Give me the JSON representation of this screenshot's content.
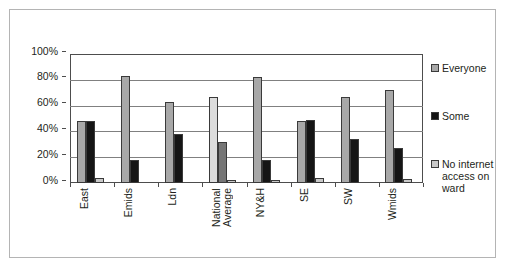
{
  "chart_data": {
    "type": "bar",
    "title": "",
    "subtitle": "",
    "xlabel": "",
    "ylabel": "",
    "ylim": [
      0,
      100
    ],
    "yticks": [
      "0%",
      "20%",
      "40%",
      "60%",
      "80%",
      "100%"
    ],
    "ytick_values": [
      0,
      20,
      40,
      60,
      80,
      100
    ],
    "grid": true,
    "legend_position": "right",
    "categories": [
      "East",
      "Emids",
      "Ldn",
      "National Average",
      "NY&H",
      "SE",
      "SW",
      "Wmids"
    ],
    "category_lines": [
      [
        "East"
      ],
      [
        "Emids"
      ],
      [
        "Ldn"
      ],
      [
        "National",
        "Average"
      ],
      [
        "NY&H"
      ],
      [
        "SE"
      ],
      [
        "SW"
      ],
      [
        "Wmids"
      ]
    ],
    "series": [
      {
        "name": "Everyone",
        "color": "#a8a8a8",
        "values": [
          48,
          83,
          63,
          67,
          82,
          48,
          67,
          72
        ]
      },
      {
        "name": "Some",
        "color": "#151515",
        "values": [
          48,
          18,
          38,
          32,
          18,
          49,
          34,
          27
        ]
      },
      {
        "name": "No internet access on ward",
        "color": "#c9c9c9",
        "values": [
          4,
          0,
          0,
          2,
          2,
          4,
          0,
          3
        ]
      }
    ]
  },
  "legend": {
    "items": [
      {
        "label": "Everyone",
        "swatch": "everyone"
      },
      {
        "label": "Some",
        "swatch": "some"
      },
      {
        "label": "No internet access on ward",
        "swatch": "nointernet"
      }
    ]
  },
  "axes": {
    "y": {
      "tick_labels": [
        "100%",
        "80%",
        "60%",
        "40%",
        "20%",
        "0%"
      ]
    }
  },
  "colors": {
    "everyone": "#a8a8a8",
    "some": "#151515",
    "no_internet": "#c9c9c9",
    "frame": "#4d4d4d",
    "gridline": "#808080",
    "panel_border": "#b4b4b4",
    "text": "#231f20",
    "background": "#ffffff"
  }
}
